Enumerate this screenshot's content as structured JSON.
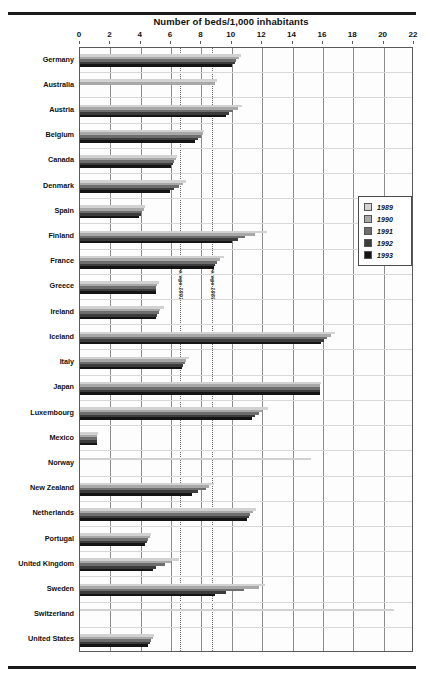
{
  "figure": {
    "title": "Number of beds/1,000 inhabitants"
  },
  "legend": {
    "position": "right-middle",
    "entries": [
      {
        "label": "1989",
        "color": "#d2d2d2"
      },
      {
        "label": "1990",
        "color": "#a8a8a8"
      },
      {
        "label": "1991",
        "color": "#6e6e6e"
      },
      {
        "label": "1992",
        "color": "#3c3c3c"
      },
      {
        "label": "1993",
        "color": "#141414"
      }
    ]
  },
  "annotations": [
    {
      "name": "average-1993",
      "label": "Average 1993",
      "value": 6.6
    },
    {
      "name": "average-1989",
      "label": "Average 1989",
      "value": 8.7
    }
  ],
  "chart_data": {
    "type": "bar",
    "orientation": "horizontal",
    "title": "Number of beds/1,000 inhabitants",
    "xlabel": "Number of beds/1,000 inhabitants",
    "ylabel": "",
    "xlim": [
      0,
      22
    ],
    "xticks": [
      0,
      2,
      4,
      6,
      8,
      10,
      12,
      14,
      16,
      18,
      20,
      22
    ],
    "grid": true,
    "legend_position": "right",
    "categories": [
      "Germany",
      "Australia",
      "Austria",
      "Belgium",
      "Canada",
      "Denmark",
      "Spain",
      "Finland",
      "France",
      "Greece",
      "Ireland",
      "Iceland",
      "Italy",
      "Japan",
      "Luxembourg",
      "Mexico",
      "Norway",
      "New Zealand",
      "Netherlands",
      "Portugal",
      "United Kingdom",
      "Sweden",
      "Switzerland",
      "United States"
    ],
    "series": [
      {
        "name": "1989",
        "color": "#d2d2d2",
        "values": [
          10.6,
          9.0,
          10.7,
          8.2,
          6.4,
          7.0,
          4.3,
          12.3,
          9.5,
          5.2,
          5.5,
          16.8,
          7.2,
          15.9,
          12.4,
          1.2,
          15.2,
          8.8,
          11.6,
          4.7,
          6.5,
          12.2,
          20.7,
          4.9
        ]
      },
      {
        "name": "1990",
        "color": "#a8a8a8",
        "values": [
          10.5,
          8.9,
          10.4,
          8.1,
          6.3,
          6.8,
          4.2,
          11.5,
          9.2,
          5.1,
          5.3,
          16.5,
          7.0,
          15.8,
          12.0,
          1.1,
          null,
          8.5,
          11.4,
          4.6,
          6.0,
          11.8,
          null,
          4.8
        ]
      },
      {
        "name": "1991",
        "color": "#6e6e6e",
        "values": [
          10.3,
          null,
          10.1,
          8.0,
          6.2,
          6.5,
          4.1,
          10.9,
          9.0,
          5.0,
          5.2,
          16.3,
          6.9,
          15.8,
          11.8,
          1.1,
          null,
          8.3,
          11.2,
          4.5,
          5.6,
          10.8,
          null,
          4.7
        ]
      },
      {
        "name": "1992",
        "color": "#3c3c3c",
        "values": [
          10.2,
          null,
          9.8,
          7.8,
          6.1,
          6.2,
          4.0,
          10.4,
          8.9,
          5.0,
          5.1,
          16.1,
          6.8,
          15.8,
          11.5,
          1.1,
          null,
          7.8,
          11.1,
          4.4,
          5.0,
          9.6,
          null,
          4.6
        ]
      },
      {
        "name": "1993",
        "color": "#141414",
        "values": [
          10.0,
          null,
          9.6,
          7.6,
          6.0,
          5.9,
          3.9,
          10.0,
          8.8,
          5.0,
          5.0,
          15.9,
          6.7,
          15.8,
          11.3,
          1.1,
          null,
          7.4,
          11.0,
          4.3,
          4.8,
          8.9,
          null,
          4.5
        ]
      }
    ]
  }
}
